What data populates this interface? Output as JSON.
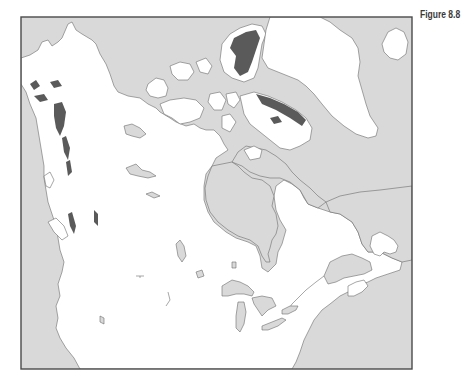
{
  "figure": {
    "label": "Figure 8.8"
  },
  "map": {
    "region": "Canada and northern North America",
    "frame": {
      "x": 21,
      "y": 17,
      "width": 391,
      "height": 352
    },
    "colors": {
      "water": "#d9d9d9",
      "land": "#ffffff",
      "highlight": "#5a5a5a",
      "coastline": "#6b6b6b",
      "frame": "#4a4a4a"
    },
    "legend": []
  }
}
